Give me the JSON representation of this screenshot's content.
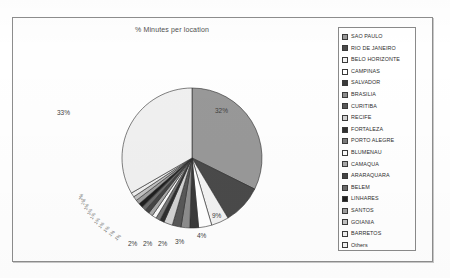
{
  "chart_data": {
    "type": "pie",
    "title": "% Minutes per location",
    "xlabel": "",
    "ylabel": "",
    "legend_position": "right",
    "grid": false,
    "categories": [
      "SAO PAULO",
      "RIO DE JANEIRO",
      "BELO HORIZONTE",
      "CAMPINAS",
      "SALVADOR",
      "BRASILIA",
      "CURITIBA",
      "RECIFE",
      "FORTALEZA",
      "PORTO ALEGRE",
      "BLUMENAU",
      "CAMAQUA",
      "ARARAQUARA",
      "BELEM",
      "LINHARES",
      "SANTOS",
      "GOIANIA",
      "BARRETOS",
      "Others"
    ],
    "values": [
      32,
      9,
      4,
      3,
      2,
      2,
      2,
      2,
      1,
      1,
      1,
      1,
      1,
      1,
      1,
      1,
      1,
      1,
      33
    ],
    "value_labels": [
      "32%",
      "9%",
      "4%",
      "3%",
      "2%",
      "2%",
      "2%",
      "2%",
      "1%",
      "1%",
      "1%",
      "1%",
      "1%",
      "1%",
      "1%",
      "1%",
      "1%",
      "1%",
      "33%"
    ],
    "slice_colors": [
      "#989898",
      "#4a4a4a",
      "#f2f2f2",
      "#ffffff",
      "#3a3a3a",
      "#8c8c8c",
      "#585858",
      "#d2d2d2",
      "#2f2f2f",
      "#7a7a7a",
      "#fafafa",
      "#a8a8a8",
      "#454545",
      "#6a6a6a",
      "#1f1f1f",
      "#9e9e9e",
      "#c0c0c0",
      "#eeeeee",
      "#f0f0f0"
    ],
    "visible_labels": [
      {
        "text": "32%",
        "left": 203,
        "top": 91
      },
      {
        "text": "9%",
        "left": 200,
        "top": 196
      },
      {
        "text": "4%",
        "left": 185,
        "top": 216
      },
      {
        "text": "3%",
        "left": 163,
        "top": 222
      },
      {
        "text": "2%",
        "left": 146,
        "top": 224
      },
      {
        "text": "2%",
        "left": 131,
        "top": 224
      },
      {
        "text": "2%",
        "left": 116,
        "top": 224
      },
      {
        "text": "33%",
        "left": 45,
        "top": 93
      }
    ],
    "tiny_labels": [
      {
        "text": "1%",
        "left": 104,
        "top": 221,
        "rot": -42
      },
      {
        "text": "1%",
        "left": 98,
        "top": 217,
        "rot": -46
      },
      {
        "text": "1%",
        "left": 93,
        "top": 213,
        "rot": -50
      },
      {
        "text": "1%",
        "left": 88,
        "top": 209,
        "rot": -54
      },
      {
        "text": "1%",
        "left": 84,
        "top": 205,
        "rot": -58
      },
      {
        "text": "1%",
        "left": 80,
        "top": 200,
        "rot": -62
      },
      {
        "text": "1%",
        "left": 77,
        "top": 196,
        "rot": -66
      },
      {
        "text": "1%",
        "left": 74,
        "top": 191,
        "rot": -70
      },
      {
        "text": "1%",
        "left": 71,
        "top": 186,
        "rot": -74
      },
      {
        "text": "1%",
        "left": 69,
        "top": 181,
        "rot": -78
      }
    ]
  },
  "legend": {
    "items": [
      {
        "label": "SAO PAULO",
        "color": "#989898"
      },
      {
        "label": "RIO DE JANEIRO",
        "color": "#4a4a4a"
      },
      {
        "label": "BELO HORIZONTE",
        "color": "#f2f2f2"
      },
      {
        "label": "CAMPINAS",
        "color": "#ffffff"
      },
      {
        "label": "SALVADOR",
        "color": "#3a3a3a"
      },
      {
        "label": "BRASILIA",
        "color": "#8c8c8c"
      },
      {
        "label": "CURITIBA",
        "color": "#585858"
      },
      {
        "label": "RECIFE",
        "color": "#d2d2d2"
      },
      {
        "label": "FORTALEZA",
        "color": "#2f2f2f"
      },
      {
        "label": "PORTO ALEGRE",
        "color": "#7a7a7a"
      },
      {
        "label": "BLUMENAU",
        "color": "#fafafa"
      },
      {
        "label": "CAMAQUA",
        "color": "#a8a8a8"
      },
      {
        "label": "ARARAQUARA",
        "color": "#454545"
      },
      {
        "label": "BELEM",
        "color": "#6a6a6a"
      },
      {
        "label": "LINHARES",
        "color": "#1f1f1f"
      },
      {
        "label": "SANTOS",
        "color": "#9e9e9e"
      },
      {
        "label": "GOIANIA",
        "color": "#c0c0c0"
      },
      {
        "label": "BARRETOS",
        "color": "#eeeeee"
      },
      {
        "label": "Others",
        "color": "#f0f0f0"
      }
    ]
  },
  "pie_geometry": {
    "cx": 180,
    "cy": 141,
    "r": 70,
    "start_angle_deg": -90
  }
}
